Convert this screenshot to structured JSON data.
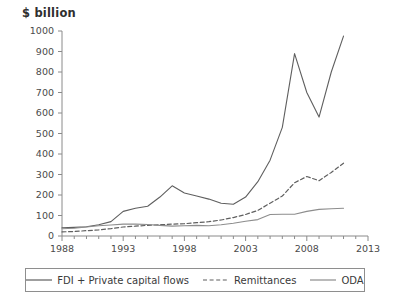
{
  "chart_data": {
    "type": "line",
    "title": "",
    "subtitle": "",
    "ylabel": "$ billion",
    "xlabel": "",
    "grid": false,
    "legend_position": "bottom",
    "xlim": [
      1988,
      2013
    ],
    "ylim": [
      0,
      1000
    ],
    "ytick_labels": [
      "0",
      "100",
      "200",
      "300",
      "400",
      "500",
      "600",
      "700",
      "800",
      "900",
      "1000"
    ],
    "yticks": [
      0,
      100,
      200,
      300,
      400,
      500,
      600,
      700,
      800,
      900,
      1000
    ],
    "xtick_labels": [
      "1988",
      "1993",
      "1998",
      "2003",
      "2008",
      "2013"
    ],
    "xticks": [
      1988,
      1993,
      1998,
      2003,
      2008,
      2013
    ],
    "minor_xticks": [
      1989,
      1990,
      1991,
      1992,
      1994,
      1995,
      1996,
      1997,
      1999,
      2000,
      2001,
      2002,
      2004,
      2005,
      2006,
      2007,
      2009,
      2010,
      2011,
      2012
    ],
    "x": [
      1988,
      1989,
      1990,
      1991,
      1992,
      1993,
      1994,
      1995,
      1996,
      1997,
      1998,
      1999,
      2000,
      2001,
      2002,
      2003,
      2004,
      2005,
      2006,
      2007,
      2008,
      2009,
      2010,
      2011
    ],
    "series": [
      {
        "name": "FDI + Private capital flows",
        "style": "solid",
        "color": "#5f5f5f",
        "values": [
          40,
          42,
          45,
          55,
          70,
          120,
          135,
          145,
          190,
          245,
          210,
          195,
          180,
          160,
          155,
          190,
          265,
          370,
          530,
          890,
          700,
          580,
          800,
          975
        ]
      },
      {
        "name": "Remittances",
        "style": "dashed",
        "color": "#5f5f5f",
        "values": [
          20,
          22,
          26,
          30,
          36,
          44,
          48,
          52,
          55,
          58,
          60,
          65,
          70,
          78,
          90,
          105,
          125,
          160,
          195,
          260,
          290,
          270,
          310,
          355
        ]
      },
      {
        "name": "ODA",
        "style": "solid",
        "color": "#8d8d8d",
        "values": [
          35,
          38,
          44,
          50,
          54,
          58,
          58,
          56,
          52,
          48,
          50,
          52,
          50,
          55,
          62,
          72,
          80,
          105,
          106,
          106,
          120,
          130,
          133,
          135
        ]
      }
    ]
  },
  "legend": {
    "entries": [
      {
        "label": "FDI + Private capital flows",
        "style": "solid"
      },
      {
        "label": "Remittances",
        "style": "dashed"
      },
      {
        "label": "ODA",
        "style": "solid-light"
      }
    ]
  }
}
